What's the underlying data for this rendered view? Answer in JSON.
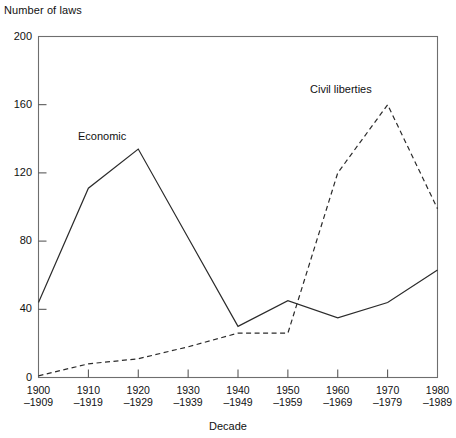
{
  "chart_data": {
    "type": "line",
    "title": "",
    "ylabel": "Number of laws",
    "xlabel": "Decade",
    "categories": [
      "1900–1909",
      "1910–1919",
      "1920–1929",
      "1930–1939",
      "1940–1949",
      "1950–1959",
      "1960–1969",
      "1970–1979",
      "1980–1989"
    ],
    "category_lines": [
      [
        "1900",
        "–1909"
      ],
      [
        "1910",
        "–1919"
      ],
      [
        "1920",
        "–1929"
      ],
      [
        "1930",
        "–1939"
      ],
      [
        "1940",
        "–1949"
      ],
      [
        "1950",
        "–1959"
      ],
      [
        "1960",
        "–1969"
      ],
      [
        "1970",
        "–1979"
      ],
      [
        "1980",
        "–1989"
      ]
    ],
    "ylim": [
      0,
      200
    ],
    "yticks": [
      0,
      40,
      80,
      120,
      160,
      200
    ],
    "ytick_labels": [
      "0",
      "40",
      "80",
      "120",
      "160",
      "200"
    ],
    "grid": false,
    "legend_position": "inline-annotation",
    "series": [
      {
        "name": "Economic",
        "style": "solid",
        "color": "#2b2b2b",
        "values": [
          44,
          111,
          134,
          82,
          30,
          45,
          35,
          44,
          63
        ]
      },
      {
        "name": "Civil liberties",
        "style": "dashed",
        "color": "#2b2b2b",
        "values": [
          1,
          8,
          11,
          18,
          26,
          26,
          120,
          160,
          99
        ]
      }
    ],
    "annotations": [
      {
        "text": "Economic",
        "series": "Economic"
      },
      {
        "text": "Civil liberties",
        "series": "Civil liberties"
      }
    ]
  },
  "axis": {
    "y_title": "Number of laws",
    "x_title": "Decade"
  }
}
